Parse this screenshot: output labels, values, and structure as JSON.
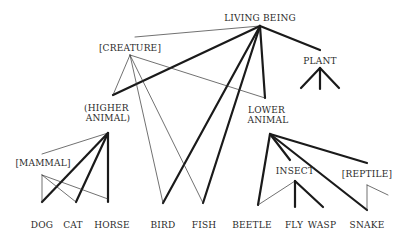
{
  "diagram": {
    "nodes": [
      {
        "id": "living_being",
        "label": "LIVING BEING"
      },
      {
        "id": "creature",
        "label": "[CREATURE]"
      },
      {
        "id": "plant",
        "label": "PLANT"
      },
      {
        "id": "higher_animal",
        "label_lines": [
          "(HIGHER",
          "ANIMAL)"
        ]
      },
      {
        "id": "lower_animal",
        "label_lines": [
          "LOWER",
          "ANIMAL"
        ]
      },
      {
        "id": "mammal",
        "label": "[MAMMAL]"
      },
      {
        "id": "insect",
        "label": "INSECT"
      },
      {
        "id": "reptile",
        "label": "[REPTILE]"
      },
      {
        "id": "dog",
        "label": "DOG"
      },
      {
        "id": "cat",
        "label": "CAT"
      },
      {
        "id": "horse",
        "label": "HORSE"
      },
      {
        "id": "bird",
        "label": "BIRD"
      },
      {
        "id": "fish",
        "label": "FISH"
      },
      {
        "id": "beetle",
        "label": "BEETLE"
      },
      {
        "id": "fly",
        "label": "FLY"
      },
      {
        "id": "wasp",
        "label": "WASP"
      },
      {
        "id": "snake",
        "label": "SNAKE"
      }
    ],
    "edges": [
      {
        "from": "living_being",
        "to": "creature",
        "weight": "thin"
      },
      {
        "from": "living_being",
        "to": "higher_animal",
        "weight": "thick"
      },
      {
        "from": "living_being",
        "to": "bird",
        "weight": "thick"
      },
      {
        "from": "living_being",
        "to": "fish",
        "weight": "thick"
      },
      {
        "from": "living_being",
        "to": "lower_animal",
        "weight": "thick"
      },
      {
        "from": "living_being",
        "to": "plant",
        "weight": "thick"
      },
      {
        "from": "creature",
        "to": "higher_animal",
        "weight": "thin"
      },
      {
        "from": "creature",
        "to": "bird",
        "weight": "thin"
      },
      {
        "from": "creature",
        "to": "fish",
        "weight": "thin"
      },
      {
        "from": "creature",
        "to": "lower_animal",
        "weight": "thin"
      },
      {
        "from": "higher_animal",
        "to": "mammal",
        "weight": "thin"
      },
      {
        "from": "higher_animal",
        "to": "dog",
        "weight": "thick"
      },
      {
        "from": "higher_animal",
        "to": "cat",
        "weight": "thick"
      },
      {
        "from": "higher_animal",
        "to": "horse",
        "weight": "thick"
      },
      {
        "from": "mammal",
        "to": "dog",
        "weight": "thin"
      },
      {
        "from": "mammal",
        "to": "cat",
        "weight": "thin"
      },
      {
        "from": "mammal",
        "to": "horse",
        "weight": "thin"
      },
      {
        "from": "lower_animal",
        "to": "beetle",
        "weight": "thick"
      },
      {
        "from": "lower_animal",
        "to": "insect",
        "weight": "thick"
      },
      {
        "from": "lower_animal",
        "to": "snake",
        "weight": "thick"
      },
      {
        "from": "lower_animal",
        "to": "reptile",
        "weight": "thick"
      },
      {
        "from": "insect",
        "to": "beetle",
        "weight": "thin"
      },
      {
        "from": "insect",
        "to": "fly",
        "weight": "thick"
      },
      {
        "from": "insect",
        "to": "wasp",
        "weight": "thick"
      },
      {
        "from": "reptile",
        "to": "snake",
        "weight": "thin"
      },
      {
        "from": "reptile",
        "to": "unnamed_reptile_child",
        "weight": "thin"
      },
      {
        "from": "plant",
        "to": "unnamed_plant_child_1",
        "weight": "thick"
      },
      {
        "from": "plant",
        "to": "unnamed_plant_child_2",
        "weight": "thick"
      },
      {
        "from": "plant",
        "to": "unnamed_plant_child_3",
        "weight": "thick"
      }
    ]
  }
}
